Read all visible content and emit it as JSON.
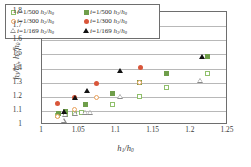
{
  "chart_data": {
    "type": "scatter",
    "title": "",
    "xlabel": "h1/h0",
    "ylabel": "h3/h0, h2/h0",
    "xlim": [
      1,
      1.25
    ],
    "ylim": [
      1,
      1.8
    ],
    "xticks": [
      "1",
      "1.05",
      "1.1",
      "1.15",
      "1.2",
      "1.25"
    ],
    "xtick_values": [
      1,
      1.05,
      1.1,
      1.15,
      1.2,
      1.25
    ],
    "yticks": [
      "1",
      "1.1",
      "1.2",
      "1.3",
      "1.4",
      "1.5",
      "1.6",
      "1.7",
      "1.8"
    ],
    "ytick_values": [
      1,
      1.1,
      1.2,
      1.3,
      1.4,
      1.5,
      1.6,
      1.7,
      1.8
    ],
    "grid": "horizontal",
    "legend_position": "upper-left",
    "series": [
      {
        "name": "i=1/500 h2/h0",
        "marker": "open-square",
        "color": "#8fbf6a",
        "points": [
          [
            1.021,
            1.065
          ],
          [
            1.031,
            1.072
          ],
          [
            1.044,
            1.082
          ],
          [
            1.053,
            1.085
          ],
          [
            1.095,
            1.148
          ],
          [
            1.131,
            1.205
          ],
          [
            1.167,
            1.262
          ],
          [
            1.222,
            1.365
          ]
        ]
      },
      {
        "name": "i=1/500 h3/h0",
        "marker": "filled-square",
        "color": "#6f9e4a",
        "points": [
          [
            1.022,
            1.082
          ],
          [
            1.031,
            1.093
          ],
          [
            1.058,
            1.148
          ],
          [
            1.095,
            1.224
          ],
          [
            1.131,
            1.299
          ],
          [
            1.167,
            1.365
          ],
          [
            1.222,
            1.482
          ]
        ]
      },
      {
        "name": "i=1/300 h2/h0",
        "marker": "open-circle",
        "color": "#e8a05a",
        "points": [
          [
            1.021,
            1.063
          ],
          [
            1.044,
            1.113
          ],
          [
            1.073,
            1.196
          ],
          [
            1.131,
            1.302
          ]
        ]
      },
      {
        "name": "i=1/300 h3/h0",
        "marker": "filled-circle",
        "color": "#d9563a",
        "points": [
          [
            1.021,
            1.151
          ],
          [
            1.044,
            1.197
          ],
          [
            1.073,
            1.296
          ],
          [
            1.132,
            1.408
          ]
        ]
      },
      {
        "name": "i=1/169 h2/h0",
        "marker": "open-triangle",
        "color": "#8a8a8a",
        "points": [
          [
            1.029,
            1.028
          ],
          [
            1.031,
            1.069
          ],
          [
            1.044,
            1.078
          ],
          [
            1.058,
            1.083
          ],
          [
            1.065,
            1.083
          ],
          [
            1.105,
            1.196
          ],
          [
            1.213,
            1.311
          ]
        ]
      },
      {
        "name": "i=1/169 h3/h0",
        "marker": "filled-triangle",
        "color": "#121212",
        "points": [
          [
            1.029,
            1.092
          ],
          [
            1.045,
            1.192
          ],
          [
            1.06,
            1.243
          ],
          [
            1.105,
            1.385
          ],
          [
            1.215,
            1.478
          ]
        ]
      }
    ],
    "legend": [
      [
        {
          "marker": "open-square",
          "slope": "i=1/500",
          "ratio_num": "2",
          "label": "i=1/500 h2/h0"
        },
        {
          "marker": "filled-square",
          "slope": "i=1/500",
          "ratio_num": "3",
          "label": "i=1/500 h3/h0"
        }
      ],
      [
        {
          "marker": "open-circle",
          "slope": "i=1/300",
          "ratio_num": "2",
          "label": "i=1/300 h2/h0"
        },
        {
          "marker": "filled-circle",
          "slope": "i=1/300",
          "ratio_num": "3",
          "label": "i=1/300 h3/h0"
        }
      ],
      [
        {
          "marker": "open-triangle",
          "slope": "i=1/169",
          "ratio_num": "2",
          "label": "i=1/169 h2/h0"
        },
        {
          "marker": "filled-triangle",
          "slope": "i=1/169",
          "ratio_num": "3",
          "label": "i=1/169 h3/h0"
        }
      ]
    ]
  }
}
